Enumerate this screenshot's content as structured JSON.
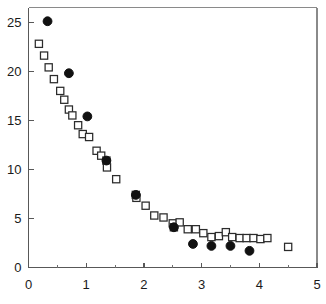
{
  "chart_data": {
    "type": "scatter",
    "title": "",
    "subtitle": "",
    "xlabel": "",
    "ylabel": "",
    "xlim": [
      0,
      5
    ],
    "ylim": [
      0,
      26.5
    ],
    "grid": false,
    "legend": null,
    "legend_position": "none",
    "x_ticks": [
      0,
      1,
      2,
      3,
      4,
      5
    ],
    "x_tick_labels": [
      "0",
      "1",
      "2",
      "3",
      "4",
      "5"
    ],
    "x_minor_ticks": [
      0.5,
      1.5,
      2.5,
      3.5,
      4.5
    ],
    "y_ticks": [
      0,
      5,
      10,
      15,
      20,
      25
    ],
    "y_tick_labels": [
      "0",
      "5",
      "10",
      "15",
      "20",
      "25"
    ],
    "y_minor_ticks": [],
    "series": [
      {
        "name": "open-squares",
        "marker": "square-open",
        "color": "#2b2b2b",
        "points": [
          [
            0.18,
            22.8
          ],
          [
            0.27,
            21.6
          ],
          [
            0.35,
            20.4
          ],
          [
            0.44,
            19.2
          ],
          [
            0.55,
            18.0
          ],
          [
            0.62,
            17.1
          ],
          [
            0.7,
            16.1
          ],
          [
            0.76,
            15.5
          ],
          [
            0.86,
            14.5
          ],
          [
            0.94,
            13.6
          ],
          [
            1.05,
            13.3
          ],
          [
            1.18,
            11.9
          ],
          [
            1.26,
            11.4
          ],
          [
            1.35,
            10.9
          ],
          [
            1.36,
            10.2
          ],
          [
            1.52,
            9.0
          ],
          [
            1.86,
            7.4
          ],
          [
            1.87,
            7.1
          ],
          [
            2.03,
            6.3
          ],
          [
            2.18,
            5.3
          ],
          [
            2.34,
            5.1
          ],
          [
            2.5,
            4.5
          ],
          [
            2.52,
            4.1
          ],
          [
            2.62,
            4.6
          ],
          [
            2.76,
            3.9
          ],
          [
            2.9,
            3.9
          ],
          [
            3.03,
            3.5
          ],
          [
            3.17,
            3.1
          ],
          [
            3.3,
            3.2
          ],
          [
            3.42,
            3.6
          ],
          [
            3.53,
            3.1
          ],
          [
            3.66,
            3.0
          ],
          [
            3.78,
            3.0
          ],
          [
            3.9,
            3.0
          ],
          [
            4.02,
            2.9
          ],
          [
            4.14,
            3.0
          ],
          [
            4.5,
            2.1
          ]
        ]
      },
      {
        "name": "filled-circles",
        "marker": "circle-filled",
        "color": "#111111",
        "points": [
          [
            0.33,
            25.1
          ],
          [
            0.7,
            19.8
          ],
          [
            1.02,
            15.4
          ],
          [
            1.35,
            10.9
          ],
          [
            1.86,
            7.4
          ],
          [
            2.52,
            4.1
          ],
          [
            2.85,
            2.4
          ],
          [
            3.17,
            2.2
          ],
          [
            3.5,
            2.2
          ],
          [
            3.83,
            1.7
          ]
        ]
      }
    ]
  },
  "axes": {
    "x_axis_name": "x-axis",
    "y_axis_name": "y-axis"
  }
}
